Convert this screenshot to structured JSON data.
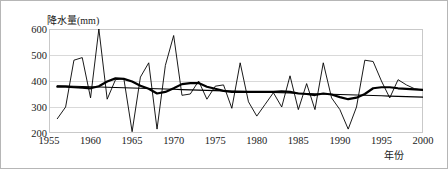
{
  "axis": {
    "y_title": "降水量(mm)",
    "x_title": "年份",
    "y_ticks": [
      "200",
      "300",
      "400",
      "500",
      "600"
    ],
    "x_ticks": [
      "1955",
      "1960",
      "1965",
      "1970",
      "1975",
      "1980",
      "1985",
      "1990",
      "1995",
      "2000"
    ]
  },
  "chart_data": {
    "type": "line",
    "title": "",
    "xlabel": "年份",
    "ylabel": "降水量(mm)",
    "xlim": [
      1955,
      2000
    ],
    "ylim": [
      200,
      600
    ],
    "grid": true,
    "legend": "none",
    "x": [
      1956,
      1957,
      1958,
      1959,
      1960,
      1961,
      1962,
      1963,
      1964,
      1965,
      1966,
      1967,
      1968,
      1969,
      1970,
      1971,
      1972,
      1973,
      1974,
      1975,
      1976,
      1977,
      1978,
      1979,
      1980,
      1981,
      1982,
      1983,
      1984,
      1985,
      1986,
      1987,
      1988,
      1989,
      1990,
      1991,
      1992,
      1993,
      1994,
      1995,
      1996,
      1997,
      1998,
      1999,
      2000
    ],
    "series": [
      {
        "name": "年降水量",
        "style": "thin",
        "values": [
          255,
          300,
          480,
          490,
          335,
          600,
          330,
          405,
          410,
          205,
          415,
          470,
          215,
          460,
          575,
          345,
          350,
          400,
          330,
          380,
          385,
          295,
          470,
          320,
          265,
          310,
          355,
          300,
          420,
          290,
          390,
          290,
          470,
          335,
          290,
          215,
          300,
          480,
          475,
          400,
          335,
          405,
          385,
          370,
          365
        ]
      },
      {
        "name": "滑动平均",
        "style": "thick",
        "values": [
          378,
          378,
          376,
          374,
          372,
          380,
          398,
          410,
          408,
          398,
          382,
          370,
          352,
          358,
          372,
          388,
          392,
          392,
          378,
          370,
          362,
          358,
          358,
          358,
          358,
          358,
          358,
          360,
          358,
          352,
          350,
          346,
          352,
          348,
          338,
          330,
          336,
          350,
          372,
          376,
          376,
          372,
          370,
          368,
          366
        ]
      },
      {
        "name": "线性趋势",
        "style": "trend",
        "values": [
          382,
          381,
          380,
          379,
          378,
          377,
          376,
          375,
          374,
          373,
          372,
          371,
          370,
          369,
          368,
          367,
          366,
          365,
          364,
          363,
          362,
          361,
          360,
          359,
          358,
          357,
          356,
          355,
          354,
          353,
          352,
          351,
          350,
          349,
          348,
          347,
          346,
          345,
          344,
          343,
          342,
          341,
          340,
          339,
          338
        ]
      }
    ]
  },
  "colors": {
    "line": "#000000",
    "grid": "#d9d9d9",
    "border": "#b6b6b6",
    "text": "#1a1a1a"
  }
}
